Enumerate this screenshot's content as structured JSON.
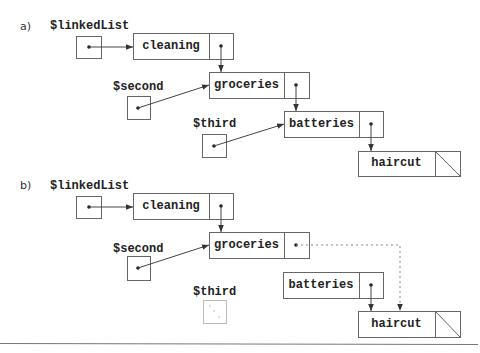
{
  "diagram": {
    "type": "linked-list-diagram",
    "colors": {
      "line": "#555555",
      "faint": "#aaaaaa",
      "background": "#ffffff"
    },
    "parts": [
      {
        "label": "a)",
        "variables": [
          {
            "name": "$linkedList",
            "points_to": "cleaning"
          },
          {
            "name": "$second",
            "points_to": "groceries"
          },
          {
            "name": "$third",
            "points_to": "batteries"
          }
        ],
        "nodes": [
          {
            "value": "cleaning",
            "next": "groceries"
          },
          {
            "value": "groceries",
            "next": "batteries"
          },
          {
            "value": "batteries",
            "next": "haircut"
          },
          {
            "value": "haircut",
            "next": null
          }
        ]
      },
      {
        "label": "b)",
        "variables": [
          {
            "name": "$linkedList",
            "points_to": "cleaning"
          },
          {
            "name": "$second",
            "points_to": "groceries"
          },
          {
            "name": "$third",
            "points_to": null,
            "state": "removed (dotted)"
          }
        ],
        "nodes": [
          {
            "value": "cleaning",
            "next": "groceries"
          },
          {
            "value": "groceries",
            "next": "haircut",
            "link_style": "dashed"
          },
          {
            "value": "batteries",
            "next": "haircut"
          },
          {
            "value": "haircut",
            "next": null
          }
        ]
      }
    ]
  }
}
